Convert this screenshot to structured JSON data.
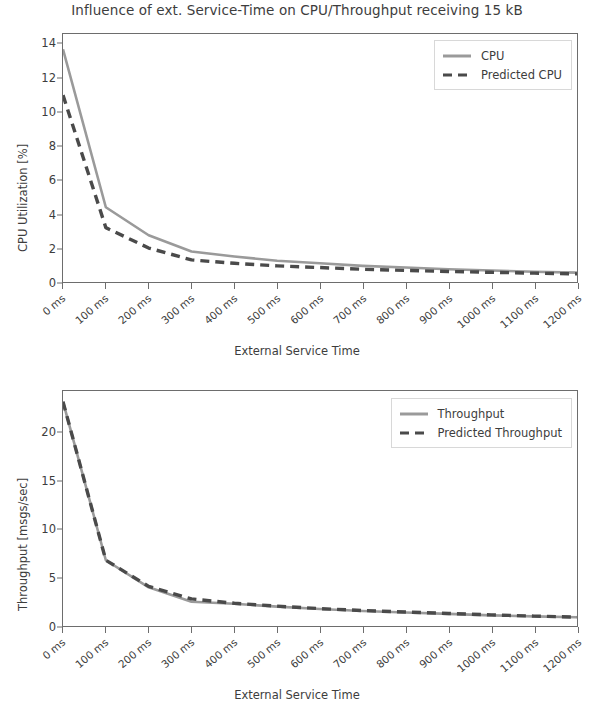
{
  "title": "Influence of ext. Service-Time on CPU/Throughput receiving 15 kB",
  "colors": {
    "measured": "#9a9a9a",
    "predicted": "#4a4a4a",
    "axis": "#6d6d6d",
    "text": "#3d3d3d",
    "background": "#ffffff"
  },
  "chart_data": [
    {
      "type": "line",
      "id": "cpu",
      "title": "Influence of ext. Service-Time on CPU/Throughput receiving 15 kB",
      "xlabel": "External Service Time",
      "ylabel": "CPU Utilization [%]",
      "x": [
        0,
        100,
        200,
        300,
        400,
        500,
        600,
        700,
        800,
        900,
        1000,
        1100,
        1200
      ],
      "xtick_labels": [
        "0 ms",
        "100 ms",
        "200 ms",
        "300 ms",
        "400 ms",
        "500 ms",
        "600 ms",
        "700 ms",
        "800 ms",
        "900 ms",
        "1000 ms",
        "1100 ms",
        "1200 ms"
      ],
      "ytick_labels": [
        "0",
        "2",
        "4",
        "6",
        "8",
        "10",
        "12",
        "14"
      ],
      "yticks": [
        0,
        2,
        4,
        6,
        8,
        10,
        12,
        14
      ],
      "ylim": [
        0,
        14.6
      ],
      "xlim": [
        0,
        1200
      ],
      "grid": false,
      "legend_position": "upper right",
      "series": [
        {
          "name": "CPU",
          "style": "solid",
          "color": "#9a9a9a",
          "values": [
            13.7,
            4.4,
            2.75,
            1.8,
            1.5,
            1.25,
            1.1,
            0.95,
            0.85,
            0.75,
            0.68,
            0.6,
            0.55
          ]
        },
        {
          "name": "Predicted CPU",
          "style": "dashed",
          "color": "#4a4a4a",
          "values": [
            11.0,
            3.2,
            2.0,
            1.3,
            1.1,
            0.95,
            0.85,
            0.75,
            0.68,
            0.62,
            0.57,
            0.52,
            0.48
          ]
        }
      ]
    },
    {
      "type": "line",
      "id": "throughput",
      "title": "",
      "xlabel": "External Service Time",
      "ylabel": "Throughput [msgs/sec]",
      "x": [
        0,
        100,
        200,
        300,
        400,
        500,
        600,
        700,
        800,
        900,
        1000,
        1100,
        1200
      ],
      "xtick_labels": [
        "0 ms",
        "100 ms",
        "200 ms",
        "300 ms",
        "400 ms",
        "500 ms",
        "600 ms",
        "700 ms",
        "800 ms",
        "900 ms",
        "1000 ms",
        "1100 ms",
        "1200 ms"
      ],
      "ytick_labels": [
        "0",
        "5",
        "10",
        "15",
        "20"
      ],
      "yticks": [
        0,
        5,
        10,
        15,
        20
      ],
      "ylim": [
        0,
        24.3
      ],
      "xlim": [
        0,
        1200
      ],
      "grid": false,
      "legend_position": "upper right",
      "series": [
        {
          "name": "Throughput",
          "style": "solid",
          "color": "#9a9a9a",
          "values": [
            23.2,
            6.8,
            4.0,
            2.5,
            2.3,
            2.0,
            1.75,
            1.55,
            1.4,
            1.25,
            1.1,
            1.0,
            0.9
          ]
        },
        {
          "name": "Predicted Throughput",
          "style": "dashed",
          "color": "#4a4a4a",
          "values": [
            23.2,
            6.8,
            4.1,
            2.8,
            2.35,
            2.05,
            1.8,
            1.6,
            1.45,
            1.3,
            1.15,
            1.02,
            0.92
          ]
        }
      ]
    }
  ]
}
